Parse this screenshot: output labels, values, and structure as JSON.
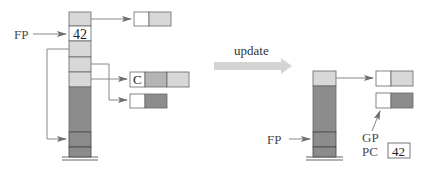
{
  "colors": {
    "light_cell": "#d8d8d8",
    "dark_cell": "#8c8c8c",
    "white_cell": "#ffffff",
    "border": "#666666",
    "arrow": "#888888",
    "update_arrow": "#d4d4d4"
  },
  "before": {
    "fp_label": "FP",
    "stack_value": "42",
    "record_c_label": "C"
  },
  "transition": {
    "label": "update"
  },
  "after": {
    "fp_label": "FP",
    "gp_label": "GP",
    "pc_label": "PC",
    "pc_value": "42"
  }
}
